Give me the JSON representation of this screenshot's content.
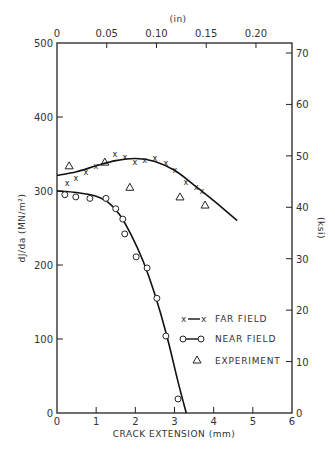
{
  "chart_data": {
    "type": "line",
    "title": "",
    "xlabel": "CRACK EXTENSION (mm)",
    "ylabel": "dJ/da (MN/m²)",
    "top_xlabel": "(in)",
    "right_ylabel": "(ksi)",
    "xlim": [
      0,
      6
    ],
    "ylim": [
      0,
      500
    ],
    "x_ticks": [
      "0",
      "1",
      "2",
      "3",
      "4",
      "5",
      "6"
    ],
    "y_ticks": [
      "0",
      "100",
      "200",
      "300",
      "400",
      "500"
    ],
    "top_ticks": [
      "0",
      "0.05",
      "0.10",
      "0.15",
      "0.20"
    ],
    "right_ticks": [
      "0",
      "10",
      "20",
      "30",
      "40",
      "50",
      "60",
      "70"
    ],
    "grid": false,
    "legend_position": "lower right",
    "series": [
      {
        "name": "FAR FIELD",
        "marker": "x",
        "points": [
          [
            0.26,
            311
          ],
          [
            0.48,
            318
          ],
          [
            0.74,
            326
          ],
          [
            0.99,
            334
          ],
          [
            1.48,
            350
          ],
          [
            1.73,
            346
          ],
          [
            1.99,
            339
          ],
          [
            2.24,
            342
          ],
          [
            2.5,
            345
          ],
          [
            2.78,
            338
          ],
          [
            3.01,
            328
          ],
          [
            3.29,
            312
          ],
          [
            3.55,
            305
          ],
          [
            3.7,
            300
          ]
        ],
        "curve": [
          [
            0,
            321
          ],
          [
            0.5,
            326
          ],
          [
            1.0,
            334
          ],
          [
            1.5,
            341
          ],
          [
            2.0,
            344
          ],
          [
            2.5,
            340
          ],
          [
            3.0,
            328
          ],
          [
            3.5,
            308
          ],
          [
            4.0,
            287
          ],
          [
            4.6,
            260
          ]
        ]
      },
      {
        "name": "NEAR FIELD",
        "marker": "o",
        "points": [
          [
            0.2,
            295
          ],
          [
            0.48,
            292
          ],
          [
            0.84,
            290
          ],
          [
            1.25,
            290
          ],
          [
            1.5,
            276
          ],
          [
            1.68,
            262
          ],
          [
            1.73,
            242
          ],
          [
            2.02,
            211
          ],
          [
            2.3,
            196
          ],
          [
            2.55,
            155
          ],
          [
            2.78,
            104
          ],
          [
            3.09,
            19
          ]
        ],
        "curve": [
          [
            0,
            300
          ],
          [
            0.5,
            298
          ],
          [
            1.0,
            293
          ],
          [
            1.3,
            285
          ],
          [
            1.6,
            268
          ],
          [
            1.9,
            240
          ],
          [
            2.2,
            205
          ],
          [
            2.5,
            160
          ],
          [
            2.8,
            105
          ],
          [
            3.1,
            40
          ],
          [
            3.3,
            0
          ]
        ]
      },
      {
        "name": "EXPERIMENT",
        "marker": "triangle",
        "points": [
          [
            0.31,
            334
          ],
          [
            1.22,
            339
          ],
          [
            1.86,
            305
          ],
          [
            3.14,
            292
          ],
          [
            3.78,
            281
          ]
        ]
      }
    ]
  },
  "legend": {
    "items": [
      {
        "symbol": "x—x",
        "label": "FAR FIELD"
      },
      {
        "symbol": "o—o",
        "label": "NEAR FIELD"
      },
      {
        "symbol": "△",
        "label": "EXPERIMENT"
      }
    ]
  }
}
